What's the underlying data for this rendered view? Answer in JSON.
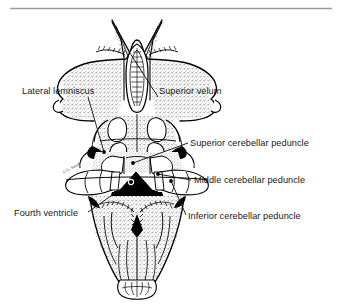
{
  "figure": {
    "top_rule_color": "#9a9a9a",
    "ink_color": "#000000",
    "stipple_color": "#6e6e6e",
    "background_color": "#ffffff",
    "artist_mark": "C.G. Smith"
  },
  "labels": [
    {
      "id": "lateral-lemniscus",
      "text": "Lateral lemniscus",
      "x": 22,
      "y": 94,
      "anchor": "start",
      "leader": {
        "x1": 88,
        "y1": 97,
        "x2": 104,
        "y2": 152
      }
    },
    {
      "id": "superior-velum",
      "text": "Superior velum",
      "x": 159,
      "y": 94,
      "anchor": "start",
      "leader": {
        "x1": 158,
        "y1": 97,
        "x2": 130,
        "y2": 53
      }
    },
    {
      "id": "superior-cerebellar-peduncle",
      "text": "Superior cerebellar peduncle",
      "x": 190,
      "y": 146,
      "anchor": "start",
      "leader": {
        "x1": 188,
        "y1": 143,
        "x2": 133,
        "y2": 163
      }
    },
    {
      "id": "middle-cerebellar-peduncle",
      "text": "Middle cerebellar peduncle",
      "x": 194,
      "y": 183,
      "anchor": "start",
      "leader": {
        "x1": 191,
        "y1": 180,
        "x2": 158,
        "y2": 174
      }
    },
    {
      "id": "inferior-cerebellar-peduncle",
      "text": "Inferior cerebellar peduncle",
      "x": 188,
      "y": 219,
      "anchor": "start",
      "leader": {
        "x1": 186,
        "y1": 215,
        "x2": 171,
        "y2": 181
      }
    },
    {
      "id": "fourth-ventricle",
      "text": "Fourth ventricle",
      "x": 14,
      "y": 216,
      "anchor": "start",
      "leader": {
        "x1": 88,
        "y1": 212,
        "x2": 131,
        "y2": 182
      }
    }
  ],
  "markers": [
    {
      "id": "marker-lateral-lemniscus",
      "cx": 104,
      "cy": 152,
      "r": 1.9,
      "type": "dot"
    },
    {
      "id": "marker-superior-cerebellar-peduncle",
      "cx": 133,
      "cy": 163,
      "r": 1.9,
      "type": "dot"
    },
    {
      "id": "marker-middle-cerebellar-peduncle",
      "cx": 158,
      "cy": 174,
      "r": 1.9,
      "type": "dot"
    },
    {
      "id": "marker-inferior-cerebellar-peduncle",
      "cx": 171,
      "cy": 181,
      "r": 1.9,
      "type": "dot"
    },
    {
      "id": "marker-fourth-ventricle",
      "cx": 131,
      "cy": 182,
      "r": 2.6,
      "type": "circle"
    }
  ],
  "structures": {
    "superior_velum": "superior medullary velum with paired pointed horns",
    "colliculi": "four colliculi of the tectum",
    "fourth_ventricle": "rhomboid fossa shown as a dark cavity",
    "medulla": "medulla oblongata with striae medullares and obex",
    "cerebellar_peduncles": "cut surfaces of superior, middle and inferior peduncles"
  }
}
